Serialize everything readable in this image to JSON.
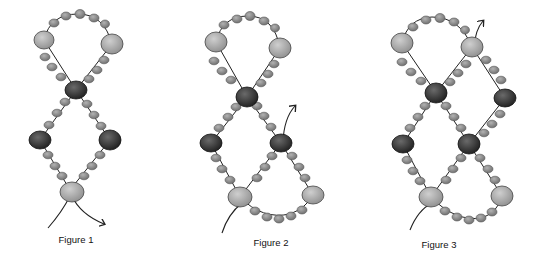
{
  "figures": [
    {
      "id": "figure-1",
      "label": "Figure 1",
      "label_x": 76,
      "label_y": 234
    },
    {
      "id": "figure-2",
      "label": "Figure 2",
      "label_x": 271,
      "label_y": 237
    },
    {
      "id": "figure-3",
      "label": "Figure 3",
      "label_x": 439,
      "label_y": 239
    }
  ],
  "colors": {
    "small_bead": "#8a8a8a",
    "large_light_bead": "#a8a8a8",
    "dark_bead": "#3a3a3a",
    "thread": "#222222",
    "outline": "#555555"
  }
}
